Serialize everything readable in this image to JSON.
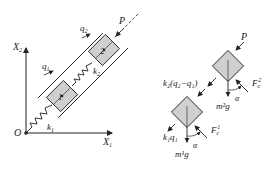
{
  "left_figure": {
    "axis_x": "X",
    "axis_x_sub": "1",
    "axis_y": "X",
    "axis_y_sub": "2",
    "origin": "O",
    "spring1": "k",
    "spring1_sub": "1",
    "spring2": "k",
    "spring2_sub": "2",
    "disp1": "q",
    "disp1_sub": "1",
    "disp2": "q",
    "disp2_sub": "2",
    "force": "P",
    "mass1": "1",
    "mass2": "2"
  },
  "right_figure": {
    "top_force": "P",
    "coupling_force": "k₂(q₂−q₁)",
    "friction2": "F",
    "friction2_sub": "c",
    "friction2_sup": "2",
    "weight2": "m²g",
    "angle2": "α",
    "spring_force1": "k₁q₁",
    "friction1": "F",
    "friction1_sub": "c",
    "friction1_sup": "1",
    "weight1": "m¹g",
    "angle1": "α"
  },
  "colors": {
    "block_fill": "#cfcfcf",
    "line": "#222222"
  }
}
